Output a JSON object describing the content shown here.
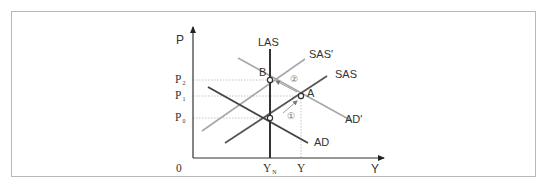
{
  "diagram": {
    "type": "AD-AS model",
    "axes": {
      "y_label": "P",
      "x_label": "Y",
      "origin_label": "0"
    },
    "price_levels": [
      {
        "label": "P",
        "sub": "2"
      },
      {
        "label": "P",
        "sub": "1"
      },
      {
        "label": "P",
        "sub": "0"
      }
    ],
    "output_levels": [
      {
        "label": "Y",
        "sub": "N"
      },
      {
        "label": "Y",
        "sub": ""
      }
    ],
    "curves": {
      "las": "LAS",
      "sas": "SAS",
      "sas_prime": "SAS'",
      "ad": "AD",
      "ad_prime": "AD'"
    },
    "points": {
      "a": "A",
      "b": "B"
    },
    "steps": {
      "step1": "①",
      "step2": "②"
    },
    "colors": {
      "frame": "#b8b8b8",
      "axis": "#333333",
      "las": "#333333",
      "ad": "#444444",
      "sas": "#555555",
      "shifted": "#a8a8a8",
      "guide": "#bbbbbb"
    }
  }
}
